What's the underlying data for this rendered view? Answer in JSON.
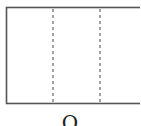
{
  "diagram": {
    "type": "folded-rectangle",
    "stroke_color": "#555555",
    "dashed_color": "#666666",
    "rectangle": {
      "x": 6,
      "y": 7,
      "width": 140,
      "height": 96
    },
    "fold_lines": [
      {
        "x": 53,
        "style": "dashed"
      },
      {
        "x": 100,
        "style": "dashed"
      }
    ],
    "panel_count": 3
  },
  "caption": {
    "label": "O"
  }
}
